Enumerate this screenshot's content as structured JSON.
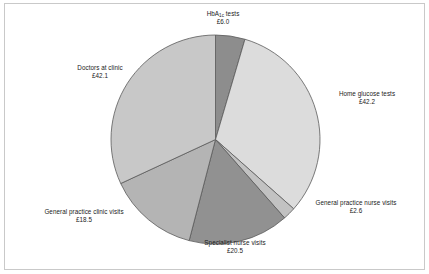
{
  "figure": {
    "border_color": "#c9c9c9",
    "background": "#ffffff"
  },
  "chart_data": {
    "type": "pie",
    "title": "",
    "subtitle": "",
    "xlabel": "",
    "ylabel": "",
    "legend_position": "none",
    "grid": false,
    "units": "£",
    "total": 131.9,
    "start_angle_deg": 0,
    "direction": "clockwise",
    "categories": [
      "HbA1c tests",
      "Home glucose tests",
      "General practice nurse visits",
      "Specialist nurse visits",
      "General practice clinic visits",
      "Doctors at clinic"
    ],
    "values": [
      6.0,
      42.2,
      2.6,
      20.5,
      18.5,
      42.1
    ],
    "value_labels": [
      "£6.0",
      "£42.2",
      "£2.6",
      "£20.5",
      "£18.5",
      "£42.1"
    ],
    "colors": [
      "#8d8d8d",
      "#dcdcdc",
      "#c2c2c2",
      "#919191",
      "#b4b4b4",
      "#c8c8c8"
    ],
    "slice_edge_color": "#5a5a5a",
    "slices": [
      {
        "name": "HbA1c tests",
        "label_line1": "HbA",
        "label_sub": "1c",
        "label_line1_tail": " tests",
        "label_line2": "£6.0",
        "value": 6.0,
        "percent": 4.5,
        "color": "#8d8d8d"
      },
      {
        "name": "Home glucose tests",
        "label_line1": "Home glucose tests",
        "label_line2": "£42.2",
        "value": 42.2,
        "percent": 32.0,
        "color": "#dcdcdc"
      },
      {
        "name": "General practice nurse visits",
        "label_line1": "General practice nurse visits",
        "label_line2": "£2.6",
        "value": 2.6,
        "percent": 2.0,
        "color": "#c2c2c2"
      },
      {
        "name": "Specialist nurse visits",
        "label_line1": "Specialist nurse visits",
        "label_line2": "£20.5",
        "value": 20.5,
        "percent": 15.5,
        "color": "#919191"
      },
      {
        "name": "General practice clinic visits",
        "label_line1": "General practice clinic visits",
        "label_line2": "£18.5",
        "value": 18.5,
        "percent": 14.0,
        "color": "#b4b4b4"
      },
      {
        "name": "Doctors at clinic",
        "label_line1": "Doctors at clinic",
        "label_line2": "£42.1",
        "value": 42.1,
        "percent": 31.9,
        "color": "#c8c8c8"
      }
    ]
  }
}
